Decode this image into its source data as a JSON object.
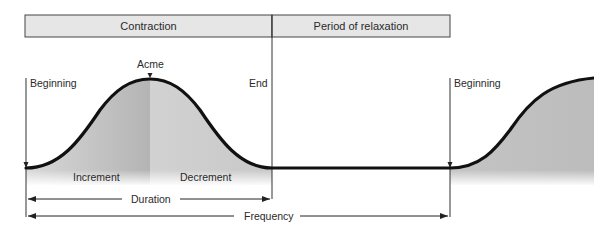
{
  "header": {
    "phases": [
      {
        "label": "Contraction"
      },
      {
        "label": "Period of relaxation"
      }
    ]
  },
  "labels": {
    "beginning_left": "Beginning",
    "acme": "Acme",
    "end": "End",
    "beginning_right": "Beginning",
    "increment": "Increment",
    "decrement": "Decrement",
    "duration": "Duration",
    "frequency": "Frequency"
  },
  "colors": {
    "header_fill": "#e6e6e6",
    "border": "#444444",
    "curve": "#111111",
    "shade_dark": "#b8b8b8",
    "shade_light": "#d4d4d4"
  }
}
